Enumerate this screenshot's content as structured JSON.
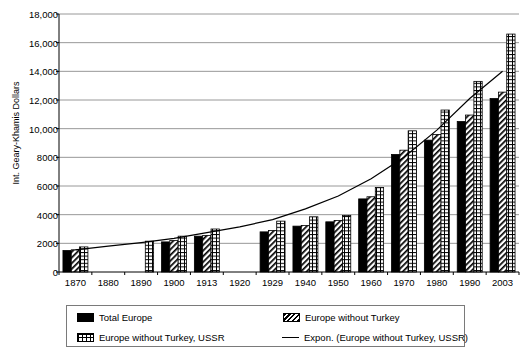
{
  "chart_data": {
    "type": "bar",
    "title": "",
    "xlabel": "",
    "ylabel": "Int. Geary-Khamis Dollars",
    "ylim": [
      0,
      18000
    ],
    "ytick_step": 2000,
    "grid": true,
    "legend_position": "bottom",
    "categories": [
      "1870",
      "1880",
      "1890",
      "1900",
      "1913",
      "1920",
      "1929",
      "1940",
      "1950",
      "1960",
      "1970",
      "1980",
      "1990",
      "2003"
    ],
    "ytick_labels": [
      "0",
      "2000",
      "4000",
      "6000",
      "8000",
      "10,000",
      "12,000",
      "14,000",
      "16,000",
      "18,000"
    ],
    "ytick_values": [
      0,
      2000,
      4000,
      6000,
      8000,
      10000,
      12000,
      14000,
      16000,
      18000
    ],
    "series": [
      {
        "name": "Total Europe",
        "pattern": "solid-black",
        "values": [
          1500,
          null,
          null,
          2100,
          2500,
          null,
          2800,
          3200,
          3500,
          5100,
          8200,
          9200,
          10500,
          12100
        ]
      },
      {
        "name": "Europe without Turkey",
        "pattern": "diagonal-hatch",
        "values": [
          1550,
          null,
          null,
          2200,
          2550,
          null,
          2900,
          3250,
          3600,
          5250,
          8500,
          9600,
          10950,
          12550
        ]
      },
      {
        "name": "Europe without Turkey, USSR",
        "pattern": "grid-hatch",
        "values": [
          1750,
          null,
          2150,
          2500,
          3000,
          null,
          3550,
          3850,
          3950,
          5900,
          9850,
          11300,
          13300,
          16600
        ]
      }
    ],
    "trendline": {
      "name": "Expon. (Europe without Turkey, USSR)",
      "pattern": "solid-line",
      "type": "exponential",
      "start_value": 1550,
      "end_value": 14000,
      "points": [
        1550,
        1800,
        2050,
        2350,
        2750,
        3150,
        3650,
        4400,
        5300,
        6500,
        8000,
        9900,
        12100,
        14000
      ]
    }
  },
  "legend": {
    "entries": [
      {
        "label": "Total Europe"
      },
      {
        "label": "Europe without Turkey"
      },
      {
        "label": "Europe without Turkey, USSR"
      },
      {
        "label": "Expon. (Europe without Turkey, USSR)"
      }
    ]
  }
}
